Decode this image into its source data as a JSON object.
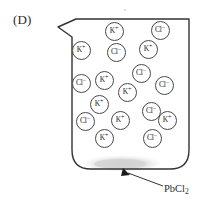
{
  "panel": {
    "label": "(D)"
  },
  "diagram": {
    "type": "beaker-with-ions",
    "vessel_name": "beaker",
    "outline_color": "#333333",
    "ion_outline_color": "#4a4a4a",
    "precipitate_color": "#d9d9d9",
    "background": "#ffffff"
  },
  "annotation": {
    "name": "precipitate-callout",
    "text": "PbCl",
    "subscript": "2",
    "arrow": "arrow-to-precipitate"
  },
  "ions": [
    {
      "id": "ion-1",
      "species": "K",
      "charge": "+",
      "x": 114,
      "y": 31
    },
    {
      "id": "ion-2",
      "species": "Cl",
      "charge": "−",
      "x": 160,
      "y": 30
    },
    {
      "id": "ion-3",
      "species": "K",
      "charge": "+",
      "x": 81,
      "y": 50
    },
    {
      "id": "ion-4",
      "species": "Cl",
      "charge": "−",
      "x": 116,
      "y": 52
    },
    {
      "id": "ion-5",
      "species": "K",
      "charge": "+",
      "x": 148,
      "y": 49
    },
    {
      "id": "ion-6",
      "species": "Cl",
      "charge": "−",
      "x": 141,
      "y": 73
    },
    {
      "id": "ion-7",
      "species": "K",
      "charge": "+",
      "x": 104,
      "y": 80
    },
    {
      "id": "ion-8",
      "species": "Cl",
      "charge": "−",
      "x": 81,
      "y": 83
    },
    {
      "id": "ion-9",
      "species": "Cl",
      "charge": "−",
      "x": 164,
      "y": 85
    },
    {
      "id": "ion-10",
      "species": "K",
      "charge": "+",
      "x": 127,
      "y": 92
    },
    {
      "id": "ion-11",
      "species": "K",
      "charge": "+",
      "x": 99,
      "y": 104
    },
    {
      "id": "ion-12",
      "species": "Cl",
      "charge": "−",
      "x": 151,
      "y": 111
    },
    {
      "id": "ion-13",
      "species": "Cl",
      "charge": "−",
      "x": 85,
      "y": 121
    },
    {
      "id": "ion-14",
      "species": "K",
      "charge": "+",
      "x": 120,
      "y": 120
    },
    {
      "id": "ion-15",
      "species": "K",
      "charge": "+",
      "x": 167,
      "y": 120
    },
    {
      "id": "ion-16",
      "species": "K",
      "charge": "+",
      "x": 104,
      "y": 138
    },
    {
      "id": "ion-17",
      "species": "Cl",
      "charge": "−",
      "x": 152,
      "y": 138
    }
  ]
}
